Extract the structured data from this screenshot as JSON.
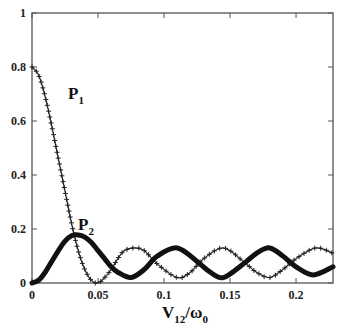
{
  "chart_data": {
    "type": "line",
    "title": "",
    "xlabel": "V12/ω0",
    "xlabel_main": "V",
    "xlabel_sub": "12",
    "xlabel_slash": "/ω",
    "xlabel_sub2": "0",
    "ylabel": "",
    "xlim": [
      0,
      0.228
    ],
    "ylim": [
      0,
      1
    ],
    "grid": false,
    "legend": "inline labels",
    "xticks": [
      0,
      0.05,
      0.1,
      0.15,
      0.2
    ],
    "xtick_labels": [
      "0",
      "0.05",
      "0.1",
      "0.15",
      "0.2"
    ],
    "yticks": [
      0,
      0.2,
      0.4,
      0.6,
      0.8,
      1
    ],
    "ytick_labels": [
      "0",
      "0.2",
      "0.4",
      "0.6",
      "0.8",
      "1"
    ],
    "series": [
      {
        "name": "P1",
        "label_main": "P",
        "label_sub": "1",
        "marker": "+",
        "x": [
          0,
          0.005,
          0.01,
          0.015,
          0.02,
          0.025,
          0.03,
          0.035,
          0.04,
          0.045,
          0.05,
          0.055,
          0.06,
          0.065,
          0.07,
          0.078,
          0.085,
          0.095,
          0.11,
          0.12,
          0.13,
          0.145,
          0.16,
          0.17,
          0.18,
          0.19,
          0.2,
          0.215,
          0.228
        ],
        "values": [
          0.8,
          0.77,
          0.69,
          0.58,
          0.46,
          0.34,
          0.22,
          0.12,
          0.05,
          0.01,
          0.0,
          0.02,
          0.05,
          0.09,
          0.12,
          0.13,
          0.12,
          0.07,
          0.02,
          0.04,
          0.09,
          0.13,
          0.08,
          0.04,
          0.02,
          0.05,
          0.09,
          0.13,
          0.11
        ]
      },
      {
        "name": "P2",
        "label_main": "P",
        "label_sub": "2",
        "marker": "diamond",
        "x": [
          0,
          0.005,
          0.01,
          0.015,
          0.02,
          0.025,
          0.03,
          0.035,
          0.04,
          0.045,
          0.05,
          0.055,
          0.06,
          0.065,
          0.075,
          0.085,
          0.095,
          0.11,
          0.125,
          0.135,
          0.145,
          0.16,
          0.17,
          0.18,
          0.19,
          0.2,
          0.213,
          0.228
        ],
        "values": [
          0.0,
          0.01,
          0.04,
          0.08,
          0.12,
          0.155,
          0.175,
          0.178,
          0.17,
          0.15,
          0.12,
          0.09,
          0.06,
          0.04,
          0.02,
          0.05,
          0.1,
          0.13,
          0.08,
          0.04,
          0.02,
          0.07,
          0.11,
          0.13,
          0.1,
          0.06,
          0.03,
          0.06
        ]
      }
    ]
  },
  "labels": {
    "p1_main": "P",
    "p1_sub": "1",
    "p2_main": "P",
    "p2_sub": "2"
  }
}
